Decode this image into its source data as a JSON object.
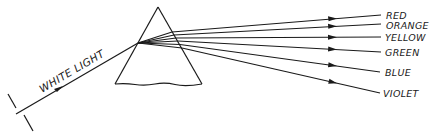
{
  "diagram": {
    "incident_label": "WHITE LIGHT",
    "spectrum_labels": [
      {
        "name": "RED",
        "y": 15
      },
      {
        "name": "ORANGE",
        "y": 24
      },
      {
        "name": "YELLOW",
        "y": 37
      },
      {
        "name": "GREEN",
        "y": 52
      },
      {
        "name": "BLUE",
        "y": 72
      },
      {
        "name": "VIOLET",
        "y": 93
      }
    ],
    "colors": {
      "line": "#1a1a1a",
      "background": "#ffffff"
    }
  }
}
